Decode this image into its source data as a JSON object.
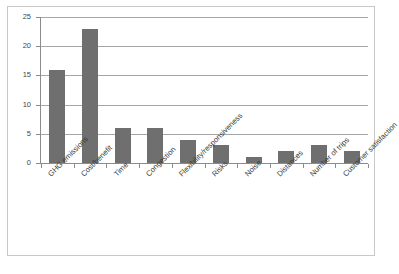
{
  "chart_data": {
    "type": "bar",
    "title": "",
    "subtitle": "",
    "xlabel": "",
    "ylabel": "",
    "ylim": [
      0,
      25
    ],
    "yticks": [
      0,
      5,
      10,
      15,
      20,
      25
    ],
    "grid": true,
    "legend": false,
    "legend_position": "none",
    "orientation": "vertical",
    "bar_color": "#6f6f6f",
    "gridline_color": "#a6a6a6",
    "axis_color": "#8c8c8c",
    "frame_color": "#c9c9c9",
    "background_color": "#ffffff",
    "categories": [
      "GHG emissions",
      "Cost/benefit",
      "Time",
      "Congestion",
      "Flexibility/responsiveness",
      "Risks",
      "Noise",
      "Distances",
      "Number of trips",
      "Customer satisfaction"
    ],
    "values": [
      16,
      23,
      6,
      6,
      4,
      3,
      1,
      2,
      3,
      2
    ],
    "ytick_labels": [
      "0",
      "5",
      "10",
      "15",
      "20",
      "25"
    ]
  }
}
